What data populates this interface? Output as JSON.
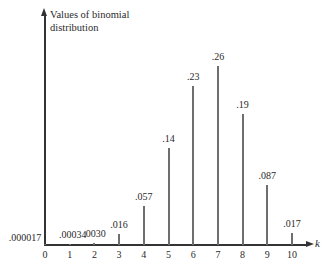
{
  "chart_data": {
    "type": "bar",
    "title": "",
    "xlabel": "k",
    "ylabel": "Values of binomial distribution",
    "categories": [
      "0",
      "1",
      "2",
      "3",
      "4",
      "5",
      "6",
      "7",
      "8",
      "9",
      "10"
    ],
    "values": [
      1.7e-05,
      0.00034,
      0.003,
      0.016,
      0.057,
      0.14,
      0.23,
      0.26,
      0.19,
      0.087,
      0.017
    ],
    "value_labels": [
      ".000017",
      ".00034",
      ".0030",
      ".016",
      ".057",
      ".14",
      ".23",
      ".26",
      ".19",
      ".087",
      ".017"
    ],
    "ylim": [
      0,
      0.28
    ],
    "grid": false,
    "legend": null,
    "bar_color": "#6e6e6e",
    "axis_color": "#333333"
  }
}
